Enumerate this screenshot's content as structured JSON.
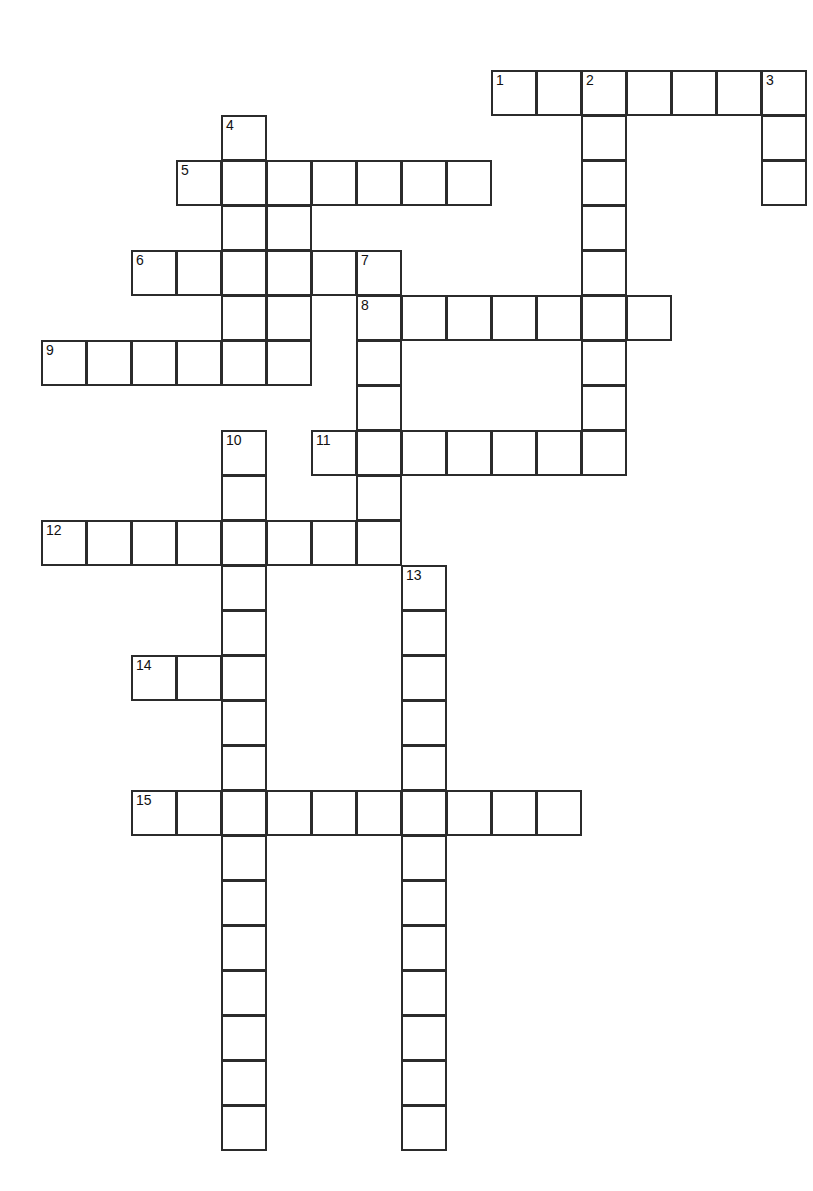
{
  "page": {
    "kind": "crossword-puzzle-grid",
    "width": 813,
    "height": 1191,
    "background_color": "#ffffff",
    "line_color": "#2b2b2b",
    "cell_size": 45,
    "origin_x": 41,
    "origin_y": 70
  },
  "grid": {
    "columns": 17,
    "rows": 24,
    "cells": [
      {
        "col": 10,
        "row": 0,
        "number": "1"
      },
      {
        "col": 11,
        "row": 0,
        "number": ""
      },
      {
        "col": 12,
        "row": 0,
        "number": "2"
      },
      {
        "col": 13,
        "row": 0,
        "number": ""
      },
      {
        "col": 14,
        "row": 0,
        "number": ""
      },
      {
        "col": 15,
        "row": 0,
        "number": ""
      },
      {
        "col": 16,
        "row": 0,
        "number": "3"
      },
      {
        "col": 12,
        "row": 1,
        "number": ""
      },
      {
        "col": 16,
        "row": 1,
        "number": ""
      },
      {
        "col": 4,
        "row": 1,
        "number": "4"
      },
      {
        "col": 3,
        "row": 2,
        "number": "5"
      },
      {
        "col": 4,
        "row": 2,
        "number": ""
      },
      {
        "col": 5,
        "row": 2,
        "number": ""
      },
      {
        "col": 6,
        "row": 2,
        "number": ""
      },
      {
        "col": 7,
        "row": 2,
        "number": ""
      },
      {
        "col": 8,
        "row": 2,
        "number": ""
      },
      {
        "col": 9,
        "row": 2,
        "number": ""
      },
      {
        "col": 12,
        "row": 2,
        "number": ""
      },
      {
        "col": 16,
        "row": 2,
        "number": ""
      },
      {
        "col": 4,
        "row": 3,
        "number": ""
      },
      {
        "col": 5,
        "row": 3,
        "number": ""
      },
      {
        "col": 12,
        "row": 3,
        "number": ""
      },
      {
        "col": 2,
        "row": 4,
        "number": "6"
      },
      {
        "col": 3,
        "row": 4,
        "number": ""
      },
      {
        "col": 4,
        "row": 4,
        "number": ""
      },
      {
        "col": 5,
        "row": 4,
        "number": ""
      },
      {
        "col": 6,
        "row": 4,
        "number": ""
      },
      {
        "col": 7,
        "row": 4,
        "number": "7"
      },
      {
        "col": 12,
        "row": 4,
        "number": ""
      },
      {
        "col": 4,
        "row": 5,
        "number": ""
      },
      {
        "col": 5,
        "row": 5,
        "number": ""
      },
      {
        "col": 7,
        "row": 5,
        "number": "8"
      },
      {
        "col": 8,
        "row": 5,
        "number": ""
      },
      {
        "col": 9,
        "row": 5,
        "number": ""
      },
      {
        "col": 10,
        "row": 5,
        "number": ""
      },
      {
        "col": 11,
        "row": 5,
        "number": ""
      },
      {
        "col": 12,
        "row": 5,
        "number": ""
      },
      {
        "col": 13,
        "row": 5,
        "number": ""
      },
      {
        "col": 0,
        "row": 6,
        "number": "9"
      },
      {
        "col": 1,
        "row": 6,
        "number": ""
      },
      {
        "col": 2,
        "row": 6,
        "number": ""
      },
      {
        "col": 3,
        "row": 6,
        "number": ""
      },
      {
        "col": 4,
        "row": 6,
        "number": ""
      },
      {
        "col": 5,
        "row": 6,
        "number": ""
      },
      {
        "col": 7,
        "row": 6,
        "number": ""
      },
      {
        "col": 12,
        "row": 6,
        "number": ""
      },
      {
        "col": 7,
        "row": 7,
        "number": ""
      },
      {
        "col": 12,
        "row": 7,
        "number": ""
      },
      {
        "col": 4,
        "row": 8,
        "number": "10"
      },
      {
        "col": 6,
        "row": 8,
        "number": "11"
      },
      {
        "col": 7,
        "row": 8,
        "number": ""
      },
      {
        "col": 8,
        "row": 8,
        "number": ""
      },
      {
        "col": 9,
        "row": 8,
        "number": ""
      },
      {
        "col": 10,
        "row": 8,
        "number": ""
      },
      {
        "col": 11,
        "row": 8,
        "number": ""
      },
      {
        "col": 12,
        "row": 8,
        "number": ""
      },
      {
        "col": 4,
        "row": 9,
        "number": ""
      },
      {
        "col": 7,
        "row": 9,
        "number": ""
      },
      {
        "col": 0,
        "row": 10,
        "number": "12"
      },
      {
        "col": 1,
        "row": 10,
        "number": ""
      },
      {
        "col": 2,
        "row": 10,
        "number": ""
      },
      {
        "col": 3,
        "row": 10,
        "number": ""
      },
      {
        "col": 4,
        "row": 10,
        "number": ""
      },
      {
        "col": 5,
        "row": 10,
        "number": ""
      },
      {
        "col": 6,
        "row": 10,
        "number": ""
      },
      {
        "col": 7,
        "row": 10,
        "number": ""
      },
      {
        "col": 4,
        "row": 11,
        "number": ""
      },
      {
        "col": 8,
        "row": 11,
        "number": "13"
      },
      {
        "col": 4,
        "row": 12,
        "number": ""
      },
      {
        "col": 8,
        "row": 12,
        "number": ""
      },
      {
        "col": 2,
        "row": 13,
        "number": "14"
      },
      {
        "col": 3,
        "row": 13,
        "number": ""
      },
      {
        "col": 4,
        "row": 13,
        "number": ""
      },
      {
        "col": 8,
        "row": 13,
        "number": ""
      },
      {
        "col": 4,
        "row": 14,
        "number": ""
      },
      {
        "col": 8,
        "row": 14,
        "number": ""
      },
      {
        "col": 4,
        "row": 15,
        "number": ""
      },
      {
        "col": 8,
        "row": 15,
        "number": ""
      },
      {
        "col": 2,
        "row": 16,
        "number": "15"
      },
      {
        "col": 3,
        "row": 16,
        "number": ""
      },
      {
        "col": 4,
        "row": 16,
        "number": ""
      },
      {
        "col": 5,
        "row": 16,
        "number": ""
      },
      {
        "col": 6,
        "row": 16,
        "number": ""
      },
      {
        "col": 7,
        "row": 16,
        "number": ""
      },
      {
        "col": 8,
        "row": 16,
        "number": ""
      },
      {
        "col": 9,
        "row": 16,
        "number": ""
      },
      {
        "col": 10,
        "row": 16,
        "number": ""
      },
      {
        "col": 11,
        "row": 16,
        "number": ""
      },
      {
        "col": 4,
        "row": 17,
        "number": ""
      },
      {
        "col": 8,
        "row": 17,
        "number": ""
      },
      {
        "col": 4,
        "row": 18,
        "number": ""
      },
      {
        "col": 8,
        "row": 18,
        "number": ""
      },
      {
        "col": 4,
        "row": 19,
        "number": ""
      },
      {
        "col": 8,
        "row": 19,
        "number": ""
      },
      {
        "col": 4,
        "row": 20,
        "number": ""
      },
      {
        "col": 8,
        "row": 20,
        "number": ""
      },
      {
        "col": 4,
        "row": 21,
        "number": ""
      },
      {
        "col": 8,
        "row": 21,
        "number": ""
      },
      {
        "col": 4,
        "row": 22,
        "number": ""
      },
      {
        "col": 8,
        "row": 22,
        "number": ""
      },
      {
        "col": 4,
        "row": 23,
        "number": ""
      },
      {
        "col": 8,
        "row": 23,
        "number": ""
      }
    ],
    "entry_numbers": [
      "1",
      "2",
      "3",
      "4",
      "5",
      "6",
      "7",
      "8",
      "9",
      "10",
      "11",
      "12",
      "13",
      "14",
      "15"
    ],
    "entries": [
      {
        "number": "1",
        "direction": "across",
        "length": 6,
        "start_col": 10,
        "start_row": 0
      },
      {
        "number": "2",
        "direction": "down",
        "length": 9,
        "start_col": 12,
        "start_row": 0
      },
      {
        "number": "3",
        "direction": "down",
        "length": 3,
        "start_col": 16,
        "start_row": 0
      },
      {
        "number": "4",
        "direction": "down",
        "length": 6,
        "start_col": 4,
        "start_row": 1
      },
      {
        "number": "5",
        "direction": "across",
        "length": 7,
        "start_col": 3,
        "start_row": 2
      },
      {
        "number": "6",
        "direction": "across",
        "length": 6,
        "start_col": 2,
        "start_row": 4
      },
      {
        "number": "7",
        "direction": "down",
        "length": 7,
        "start_col": 7,
        "start_row": 4
      },
      {
        "number": "8",
        "direction": "across",
        "length": 7,
        "start_col": 7,
        "start_row": 5
      },
      {
        "number": "9",
        "direction": "across",
        "length": 6,
        "start_col": 0,
        "start_row": 6
      },
      {
        "number": "10",
        "direction": "down",
        "length": 16,
        "start_col": 4,
        "start_row": 8
      },
      {
        "number": "11",
        "direction": "across",
        "length": 7,
        "start_col": 6,
        "start_row": 8
      },
      {
        "number": "12",
        "direction": "across",
        "length": 8,
        "start_col": 0,
        "start_row": 10
      },
      {
        "number": "13",
        "direction": "down",
        "length": 13,
        "start_col": 8,
        "start_row": 11
      },
      {
        "number": "14",
        "direction": "across",
        "length": 3,
        "start_col": 2,
        "start_row": 13
      },
      {
        "number": "15",
        "direction": "across",
        "length": 10,
        "start_col": 2,
        "start_row": 16
      }
    ]
  }
}
